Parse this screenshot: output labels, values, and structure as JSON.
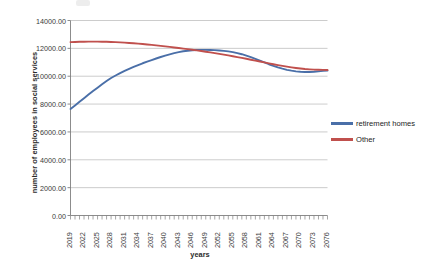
{
  "chart_data": {
    "type": "line",
    "title": "",
    "xlabel": "years",
    "ylabel": "number of employees in social services",
    "ylim": [
      0,
      14000
    ],
    "yticks": [
      0,
      2000,
      4000,
      6000,
      8000,
      10000,
      12000,
      14000
    ],
    "ytick_labels": [
      "0.00",
      "2000.00",
      "4000.00",
      "6000.00",
      "8000.00",
      "10000.00",
      "12000.00",
      "14000.00"
    ],
    "grid": true,
    "grid_axis": "y",
    "legend_position": "right",
    "x": [
      2019,
      2020,
      2021,
      2022,
      2023,
      2024,
      2025,
      2026,
      2027,
      2028,
      2029,
      2030,
      2031,
      2032,
      2033,
      2034,
      2035,
      2036,
      2037,
      2038,
      2039,
      2040,
      2041,
      2042,
      2043,
      2044,
      2045,
      2046,
      2047,
      2048,
      2049,
      2050,
      2051,
      2052,
      2053,
      2054,
      2055,
      2056,
      2057,
      2058,
      2059,
      2060,
      2061,
      2062,
      2063,
      2064,
      2065,
      2066,
      2067,
      2068,
      2069,
      2070,
      2071,
      2072,
      2073,
      2074,
      2075,
      2076
    ],
    "xtick_labels": [
      "2019",
      "2022",
      "2025",
      "2028",
      "2031",
      "2034",
      "2037",
      "2040",
      "2043",
      "2046",
      "2049",
      "2052",
      "2055",
      "2058",
      "2061",
      "2064",
      "2067",
      "2070",
      "2073",
      "2076"
    ],
    "xtick_values": [
      2019,
      2022,
      2025,
      2028,
      2031,
      2034,
      2037,
      2040,
      2043,
      2046,
      2049,
      2052,
      2055,
      2058,
      2061,
      2064,
      2067,
      2070,
      2073,
      2076
    ],
    "series": [
      {
        "name": "retirement homes",
        "color": "#4A6FA8",
        "values": [
          7650,
          7900,
          8160,
          8420,
          8680,
          8930,
          9180,
          9420,
          9650,
          9870,
          10050,
          10220,
          10380,
          10530,
          10670,
          10800,
          10930,
          11050,
          11160,
          11270,
          11380,
          11480,
          11570,
          11660,
          11730,
          11790,
          11830,
          11860,
          11880,
          11890,
          11890,
          11880,
          11870,
          11850,
          11820,
          11780,
          11730,
          11660,
          11580,
          11480,
          11370,
          11250,
          11120,
          10990,
          10860,
          10740,
          10630,
          10540,
          10460,
          10400,
          10350,
          10320,
          10300,
          10300,
          10320,
          10350,
          10380,
          10400
        ]
      },
      {
        "name": "Other",
        "color": "#C0504D",
        "values": [
          12450,
          12460,
          12470,
          12475,
          12480,
          12480,
          12480,
          12475,
          12470,
          12460,
          12445,
          12430,
          12410,
          12390,
          12365,
          12340,
          12310,
          12280,
          12250,
          12215,
          12180,
          12145,
          12105,
          12065,
          12025,
          11985,
          11945,
          11900,
          11855,
          11810,
          11760,
          11710,
          11660,
          11605,
          11550,
          11495,
          11435,
          11375,
          11315,
          11250,
          11185,
          11120,
          11055,
          10990,
          10925,
          10860,
          10800,
          10740,
          10685,
          10635,
          10590,
          10550,
          10515,
          10490,
          10470,
          10460,
          10455,
          10450
        ]
      }
    ]
  },
  "legend": {
    "items": [
      {
        "label": "retirement homes",
        "color": "#4A6FA8"
      },
      {
        "label": "Other",
        "color": "#C0504D"
      }
    ]
  }
}
